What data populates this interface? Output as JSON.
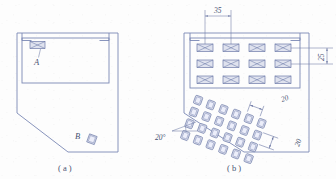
{
  "figure": {
    "kind": "engineering-drawing",
    "background_color": "#fdfdfd",
    "line_color": "#7b88b4",
    "fill_color": "#dfe2ee",
    "text_color": "#4a5272"
  },
  "panels": [
    {
      "id": "panel-a",
      "caption": "( a )",
      "caption_x": 67,
      "caption_y": 169,
      "outline": {
        "name": "plate-outline",
        "points": "17,33 118,33 118,152 68,152 17,113",
        "notch_left": "22,33 22,41 31,41",
        "notch_right": "109,33 109,41 100,41"
      },
      "inner_pocket": {
        "name": "inner-pocket",
        "x": 22,
        "y": 38,
        "width": 87,
        "height": 45
      },
      "features": [
        {
          "name": "feature-a-slot",
          "label": "A",
          "label_x": 39,
          "label_y": 64,
          "shape": "crossed-rectangle",
          "x": 30,
          "y": 41,
          "width": 15,
          "height": 7,
          "leader_from": [
            41,
            49
          ],
          "leader_to": [
            39,
            58
          ]
        },
        {
          "name": "feature-b-square",
          "label": "B",
          "label_x": 79,
          "label_y": 137,
          "shape": "tilted-square",
          "cx": 92,
          "cy": 139,
          "size": 8,
          "rotation_deg": 20,
          "leader_from": [
            86,
            136
          ],
          "leader_to": [
            89,
            137
          ]
        }
      ]
    },
    {
      "id": "panel-b",
      "caption": "( b )",
      "caption_x": 236,
      "caption_y": 169,
      "outline": {
        "name": "plate-outline",
        "points": "184,33 309,33 309,152 244,152 184,113",
        "notch_left": "190,33 190,41 199,41",
        "notch_right": "300,33 300,41 291,41"
      },
      "inner_pocket": {
        "name": "inner-pocket",
        "x": 190,
        "y": 38,
        "width": 110,
        "height": 50
      },
      "rect_hole_grid": {
        "name": "crossed-rect-hole-grid",
        "shape": "crossed-rectangle",
        "columns": 4,
        "rows": 3,
        "start_x": 198,
        "start_y": 44,
        "pitch_x": 26,
        "pitch_y": 16,
        "hole_width": 16,
        "hole_height": 7.5
      },
      "square_hole_grid": {
        "name": "tilted-square-hole-grid",
        "shape": "rounded-square",
        "columns": 6,
        "rows": 4,
        "origin_x": 196,
        "origin_y": 95,
        "pitch_x": 13.5,
        "pitch_y": 12.5,
        "hole_size": 7.5,
        "rotation_deg": 20
      },
      "dimensions": [
        {
          "name": "dim-pitch-35",
          "value": "35",
          "text_x": 222,
          "text_y": 13,
          "orientation": "horizontal",
          "measures": "column pitch of crossed-rectangle holes"
        },
        {
          "name": "dim-pitch-25",
          "value": "25",
          "text_x": 322,
          "text_y": 62,
          "orientation": "vertical-rotated",
          "measures": "row pitch of crossed-rectangle holes"
        },
        {
          "name": "dim-pitch-20-horizontal",
          "value": "20",
          "text_x": 287,
          "text_y": 100,
          "orientation": "tilted",
          "measures": "column pitch of tilted square holes"
        },
        {
          "name": "dim-pitch-20-vertical",
          "value": "20",
          "text_x": 300,
          "text_y": 144,
          "orientation": "vertical-rotated",
          "measures": "row pitch of tilted square holes"
        },
        {
          "name": "dim-angle-20",
          "value": "20°",
          "text_x": 157,
          "text_y": 140,
          "orientation": "horizontal",
          "measures": "rotation angle of the tilted square hole grid"
        }
      ]
    }
  ]
}
